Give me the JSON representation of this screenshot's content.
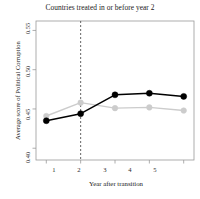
{
  "chart_data": {
    "type": "line",
    "title": "Countries treated in or before year 2",
    "xlabel": "Year after transition",
    "ylabel": "Average score of Political Corruption",
    "x": [
      1,
      2,
      3,
      4,
      5
    ],
    "xtick_labels": [
      "1",
      "2",
      "3",
      "4",
      "5"
    ],
    "ytick_labels": [
      "0.40",
      "0.45",
      "0.50",
      "0.55"
    ],
    "ytick_values": [
      0.4,
      0.45,
      0.5,
      0.55
    ],
    "xlim": [
      0.7,
      5.3
    ],
    "ylim": [
      0.385,
      0.562
    ],
    "grid": false,
    "legend": "none",
    "series": [
      {
        "name": "treated",
        "color": "#000000",
        "marker": "circle",
        "values": [
          0.435,
          0.444,
          0.468,
          0.47,
          0.466
        ]
      },
      {
        "name": "control",
        "color": "#cccccc",
        "marker": "circle",
        "values": [
          0.441,
          0.458,
          0.451,
          0.452,
          0.448
        ]
      }
    ],
    "annotations": [
      {
        "type": "vline",
        "x": 2,
        "style": "dashed",
        "color": "#555555",
        "label": "transition year 2"
      }
    ]
  }
}
